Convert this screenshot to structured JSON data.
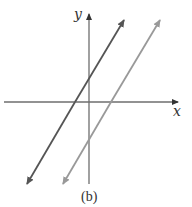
{
  "figure": {
    "caption": "(b)",
    "x_axis_label": "x",
    "y_axis_label": "y"
  },
  "colors": {
    "axis": "#6e6e6e",
    "line_dark": "#555555",
    "line_light": "#999999",
    "text": "#333333"
  },
  "lines": [
    {
      "name": "line-1",
      "shade": "dark",
      "slope_sign": "positive",
      "x_intercept": "negative",
      "y_intercept": "positive"
    },
    {
      "name": "line-2",
      "shade": "light",
      "slope_sign": "positive",
      "x_intercept": "positive",
      "y_intercept": "negative"
    }
  ]
}
